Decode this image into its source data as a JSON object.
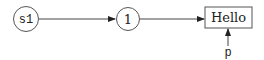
{
  "diagram": {
    "nodes": [
      {
        "id": "s1",
        "shape": "circle",
        "label": "s1"
      },
      {
        "id": "one",
        "shape": "circle",
        "label": "1"
      },
      {
        "id": "hello",
        "shape": "box",
        "label": "Hello"
      }
    ],
    "pointer": {
      "label": "p",
      "target": "hello"
    },
    "edges": [
      {
        "from": "s1",
        "to": "one"
      },
      {
        "from": "one",
        "to": "hello"
      },
      {
        "from": "p",
        "to": "hello"
      }
    ],
    "colors": {
      "stroke": "#555555",
      "text": "#222222",
      "background": "#ffffff"
    }
  }
}
